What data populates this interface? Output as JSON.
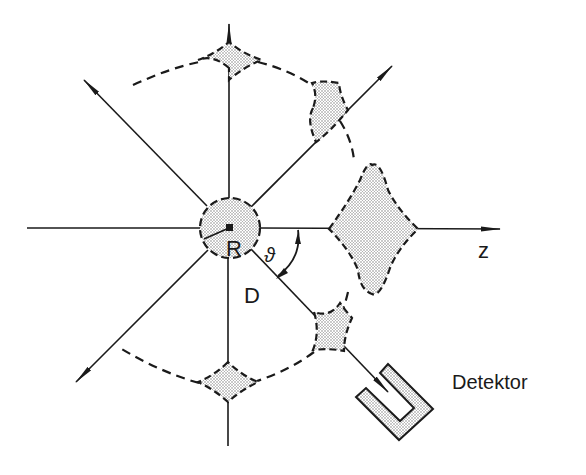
{
  "diagram": {
    "type": "angular-distribution-schematic",
    "labels": {
      "source": "R",
      "distance": "D",
      "angle": "ϑ",
      "axis": "z",
      "detector": "Detektor"
    },
    "colors": {
      "line": "#1a1a1a",
      "stipple": "#bdbdbd",
      "background": "#ffffff"
    },
    "center": {
      "x": 230,
      "y": 228
    },
    "rays": [
      {
        "name": "ray-up",
        "angle_deg": 90
      },
      {
        "name": "ray-upper-right",
        "angle_deg": 45
      },
      {
        "name": "ray-z-axis",
        "angle_deg": 0
      },
      {
        "name": "ray-lower-right-detector",
        "angle_deg": -45
      },
      {
        "name": "ray-down",
        "angle_deg": -90
      },
      {
        "name": "ray-lower-left",
        "angle_deg": -135
      },
      {
        "name": "ray-left",
        "angle_deg": 180
      },
      {
        "name": "ray-upper-left",
        "angle_deg": 135
      }
    ]
  }
}
